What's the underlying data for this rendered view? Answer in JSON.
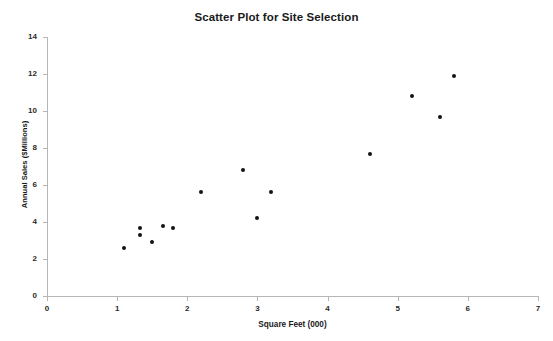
{
  "chart_data": {
    "type": "scatter",
    "title": "Scatter Plot for Site Selection",
    "xlabel": "Square Feet (000)",
    "ylabel": "Annual Sales ($Millions)",
    "xlim": [
      0,
      7
    ],
    "ylim": [
      0,
      14
    ],
    "xticks": [
      0,
      1,
      2,
      3,
      4,
      5,
      6,
      7
    ],
    "yticks": [
      0,
      2,
      4,
      6,
      8,
      10,
      12,
      14
    ],
    "grid": false,
    "legend": false,
    "marker_color": "#141414",
    "axis_color": "#b6b6b6",
    "x": [
      1.1,
      1.33,
      1.33,
      1.5,
      1.65,
      1.8,
      2.2,
      2.8,
      3.0,
      3.2,
      4.6,
      5.2,
      5.6,
      5.8
    ],
    "y": [
      2.6,
      3.3,
      3.7,
      2.9,
      3.8,
      3.7,
      5.6,
      6.8,
      4.2,
      5.6,
      7.7,
      10.8,
      9.7,
      11.9
    ],
    "points": [
      {
        "x": 1.1,
        "y": 2.6
      },
      {
        "x": 1.33,
        "y": 3.3
      },
      {
        "x": 1.33,
        "y": 3.7
      },
      {
        "x": 1.5,
        "y": 2.9
      },
      {
        "x": 1.65,
        "y": 3.8
      },
      {
        "x": 1.8,
        "y": 3.7
      },
      {
        "x": 2.2,
        "y": 5.6
      },
      {
        "x": 2.8,
        "y": 6.8
      },
      {
        "x": 3.0,
        "y": 4.2
      },
      {
        "x": 3.2,
        "y": 5.6
      },
      {
        "x": 4.6,
        "y": 7.7
      },
      {
        "x": 5.2,
        "y": 10.8
      },
      {
        "x": 5.6,
        "y": 9.7
      },
      {
        "x": 5.8,
        "y": 11.9
      }
    ]
  }
}
